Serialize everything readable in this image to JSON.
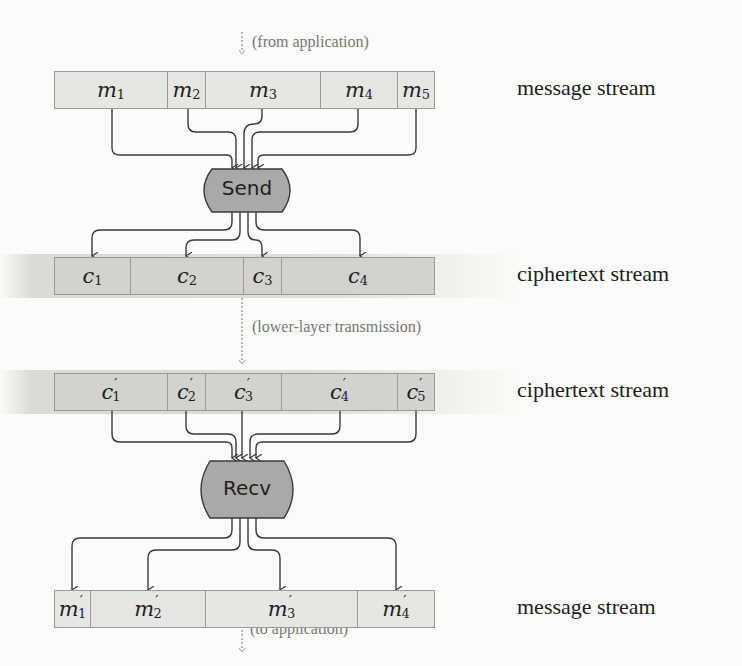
{
  "figure": {
    "top_note": "(from application)",
    "middle_note": "(lower-layer transmission)",
    "bottom_note": "(to application)",
    "send_label": "Send",
    "recv_label": "Recv",
    "colors": {
      "message_cell": "#e6e6e3",
      "ciphertext_cell": "#d2d2cf",
      "process_fill": "#a9a9a7",
      "wire": "#3a3a3a",
      "note_text": "#777777"
    },
    "rows": [
      {
        "name": "input-message-stream",
        "label": "message stream",
        "cells": [
          {
            "sym": "m",
            "sub": "1",
            "prime": ""
          },
          {
            "sym": "m",
            "sub": "2",
            "prime": ""
          },
          {
            "sym": "m",
            "sub": "3",
            "prime": ""
          },
          {
            "sym": "m",
            "sub": "4",
            "prime": ""
          },
          {
            "sym": "m",
            "sub": "5",
            "prime": ""
          }
        ]
      },
      {
        "name": "sent-ciphertext-stream",
        "label": "ciphertext stream",
        "cells": [
          {
            "sym": "c",
            "sub": "1",
            "prime": ""
          },
          {
            "sym": "c",
            "sub": "2",
            "prime": ""
          },
          {
            "sym": "c",
            "sub": "3",
            "prime": ""
          },
          {
            "sym": "c",
            "sub": "4",
            "prime": ""
          }
        ]
      },
      {
        "name": "received-ciphertext-stream",
        "label": "ciphertext stream",
        "cells": [
          {
            "sym": "c",
            "sub": "1",
            "prime": "′"
          },
          {
            "sym": "c",
            "sub": "2",
            "prime": "′"
          },
          {
            "sym": "c",
            "sub": "3",
            "prime": "′"
          },
          {
            "sym": "c",
            "sub": "4",
            "prime": "′"
          },
          {
            "sym": "c",
            "sub": "5",
            "prime": "′"
          }
        ]
      },
      {
        "name": "output-message-stream",
        "label": "message stream",
        "cells": [
          {
            "sym": "m",
            "sub": "1",
            "prime": "′"
          },
          {
            "sym": "m",
            "sub": "2",
            "prime": "′"
          },
          {
            "sym": "m",
            "sub": "3",
            "prime": "′"
          },
          {
            "sym": "m",
            "sub": "4",
            "prime": "′"
          }
        ]
      }
    ]
  }
}
